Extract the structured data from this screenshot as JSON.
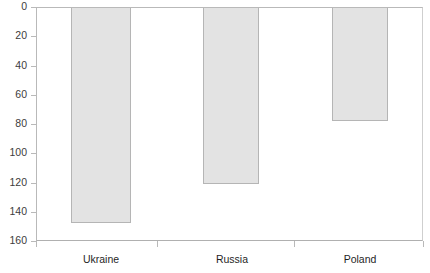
{
  "chart_data": {
    "type": "bar",
    "title": "",
    "subtitle": "",
    "xlabel": "",
    "ylabel": "",
    "categories": [
      "Ukraine",
      "Russia",
      "Poland"
    ],
    "values": [
      147,
      120,
      77
    ],
    "series": [
      {
        "name": "",
        "values": [
          147,
          120,
          77
        ]
      }
    ],
    "ylim": [
      0,
      160
    ],
    "y_inverted": true,
    "y_ticks": [
      0,
      20,
      40,
      60,
      80,
      100,
      120,
      140,
      160
    ],
    "y_tick_labels": [
      "0",
      "20",
      "40",
      "60",
      "80",
      "100",
      "120",
      "140",
      "160"
    ],
    "grid": false,
    "legend": null,
    "orientation": "vertical-inverted",
    "bar_fill_color": "#e3e3e3",
    "bar_border_color": "#b5b5b5",
    "axis_color": "#b9b9b9",
    "label_color": "#1f1f1f",
    "tick_label_color": "#3c3c3c",
    "background_color": "#ffffff",
    "annotations": []
  },
  "axes": {
    "x_tick_positions": [
      36,
      157,
      294,
      423
    ],
    "category_label_positions": [
      101,
      232,
      360
    ]
  },
  "bars_geometry": [
    {
      "name": "Ukraine",
      "left": 71,
      "width": 60,
      "bottom_px": 222
    },
    {
      "name": "Russia",
      "left": 203,
      "width": 56,
      "bottom_px": 186
    },
    {
      "name": "Poland",
      "left": 332,
      "width": 56,
      "bottom_px": 121
    }
  ]
}
